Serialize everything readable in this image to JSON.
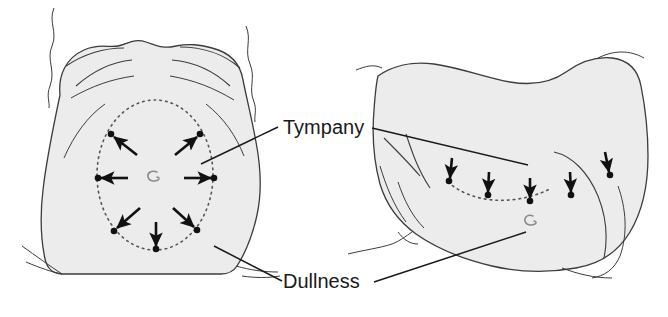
{
  "figure": {
    "background_color": "#ffffff",
    "skin_fill_color": "#ececec",
    "outline_color": "#3c3c3c",
    "marker_color": "#111111",
    "label_color": "#1a1a1a"
  },
  "labels": {
    "tympany": "Tympany",
    "dullness": "Dullness"
  },
  "panels": [
    {
      "name": "supine-anterior-view",
      "position": "left",
      "view": "anterior",
      "region_label": "Tympany",
      "boundary_label": "Dullness",
      "percussion_boundary_shape": "ellipse",
      "arrow_count": 7,
      "arrow_direction": "outward-radial",
      "umbilicus_visible": true
    },
    {
      "name": "lateral-decubitus-view",
      "position": "right",
      "view": "lateral-decubitus",
      "region_label": "Tympany",
      "boundary_label": "Dullness",
      "percussion_boundary_shape": "arc",
      "arrow_count": 5,
      "arrow_direction": "downward",
      "umbilicus_visible": true
    }
  ]
}
